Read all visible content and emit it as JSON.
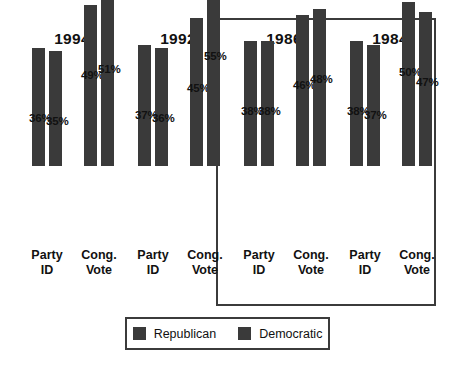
{
  "chart_data": {
    "type": "bar",
    "title": "",
    "xlabel": "",
    "ylabel": "",
    "ylim": [
      0,
      60
    ],
    "grid": false,
    "legend_position": "bottom",
    "categories": [
      "1994 Party ID",
      "1994 Cong. Vote",
      "1992 Party ID",
      "1992 Cong. Vote",
      "1986 Party ID",
      "1986 Cong. Vote",
      "1984 Party ID",
      "1984 Cong. Vote"
    ],
    "series": [
      {
        "name": "Republican",
        "color": "#3a3a3a",
        "values": [
          36,
          49,
          37,
          45,
          38,
          46,
          38,
          50
        ]
      },
      {
        "name": "Democratic",
        "color": "#3a3a3a",
        "values": [
          35,
          51,
          36,
          55,
          38,
          48,
          37,
          47
        ]
      }
    ],
    "value_labels": [
      "36%",
      "35%",
      "49%",
      "51%",
      "37%",
      "36%",
      "45%",
      "55%",
      "38%",
      "38%",
      "46%",
      "48%",
      "38%",
      "37%",
      "50%",
      "47%"
    ]
  },
  "groups": [
    {
      "year": "1994",
      "clusters": [
        {
          "label_line1": "Party",
          "label_line2": "ID",
          "republican": {
            "value": 36,
            "label": "36%"
          },
          "democratic": {
            "value": 35,
            "label": "35%"
          }
        },
        {
          "label_line1": "Cong.",
          "label_line2": "Vote",
          "republican": {
            "value": 49,
            "label": "49%"
          },
          "democratic": {
            "value": 51,
            "label": "51%"
          }
        }
      ]
    },
    {
      "year": "1992",
      "clusters": [
        {
          "label_line1": "Party",
          "label_line2": "ID",
          "republican": {
            "value": 37,
            "label": "37%"
          },
          "democratic": {
            "value": 36,
            "label": "36%"
          }
        },
        {
          "label_line1": "Cong.",
          "label_line2": "Vote",
          "republican": {
            "value": 45,
            "label": "45%"
          },
          "democratic": {
            "value": 55,
            "label": "55%"
          }
        }
      ]
    },
    {
      "year": "1986",
      "clusters": [
        {
          "label_line1": "Party",
          "label_line2": "ID",
          "republican": {
            "value": 38,
            "label": "38%"
          },
          "democratic": {
            "value": 38,
            "label": "38%"
          }
        },
        {
          "label_line1": "Cong.",
          "label_line2": "Vote",
          "republican": {
            "value": 46,
            "label": "46%"
          },
          "democratic": {
            "value": 48,
            "label": "48%"
          }
        }
      ]
    },
    {
      "year": "1984",
      "clusters": [
        {
          "label_line1": "Party",
          "label_line2": "ID",
          "republican": {
            "value": 38,
            "label": "38%"
          },
          "democratic": {
            "value": 37,
            "label": "37%"
          }
        },
        {
          "label_line1": "Cong.",
          "label_line2": "Vote",
          "republican": {
            "value": 50,
            "label": "50%"
          },
          "democratic": {
            "value": 47,
            "label": "47%"
          }
        }
      ]
    }
  ],
  "legend": {
    "entries": [
      {
        "label": "Republican",
        "color": "#3a3a3a"
      },
      {
        "label": "Democratic",
        "color": "#3a3a3a"
      }
    ]
  }
}
